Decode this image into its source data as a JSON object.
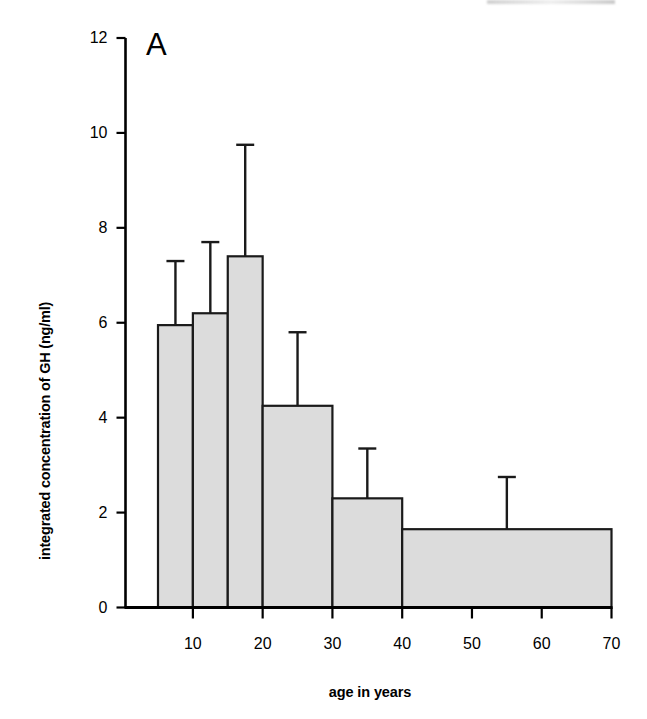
{
  "figure": {
    "panel_letter": "A",
    "background_color": "#ffffff",
    "bar_fill_color": "#dcdcdc",
    "bar_edge_color": "#1a1a1a",
    "axis_color": "#000000"
  },
  "chart_data": {
    "type": "bar",
    "title": "",
    "panel_label": "A",
    "xlabel": "age in years",
    "ylabel": "integrated concentration of GH (ng/ml)",
    "xlim": [
      5,
      70
    ],
    "ylim": [
      0,
      12
    ],
    "grid": false,
    "legend": null,
    "xticks": [
      10,
      20,
      30,
      40,
      50,
      60,
      70
    ],
    "xtick_labels": [
      "10",
      "20",
      "30",
      "40",
      "50",
      "60",
      "70"
    ],
    "yticks": [
      0,
      2,
      4,
      6,
      8,
      10,
      12
    ],
    "ytick_labels": [
      "0",
      "2",
      "4",
      "6",
      "8",
      "10",
      "12"
    ],
    "bars": [
      {
        "label": "5-10",
        "x_start": 5,
        "x_end": 10,
        "value": 5.95,
        "error_high": 7.3
      },
      {
        "label": "10-15",
        "x_start": 10,
        "x_end": 15,
        "value": 6.2,
        "error_high": 7.7
      },
      {
        "label": "15-20",
        "x_start": 15,
        "x_end": 20,
        "value": 7.4,
        "error_high": 9.75
      },
      {
        "label": "20-30",
        "x_start": 20,
        "x_end": 30,
        "value": 4.25,
        "error_high": 5.8
      },
      {
        "label": "30-40",
        "x_start": 30,
        "x_end": 40,
        "value": 2.3,
        "error_high": 3.35
      },
      {
        "label": "40-70",
        "x_start": 40,
        "x_end": 70,
        "value": 1.65,
        "error_high": 2.75
      }
    ],
    "categories": [
      "5-10",
      "10-15",
      "15-20",
      "20-30",
      "30-40",
      "40-70"
    ],
    "values": [
      5.95,
      6.2,
      7.4,
      4.25,
      2.3,
      1.65
    ],
    "error_high": [
      7.3,
      7.7,
      9.75,
      5.8,
      3.35,
      2.75
    ],
    "error_type": "upper error bar (SD)"
  }
}
